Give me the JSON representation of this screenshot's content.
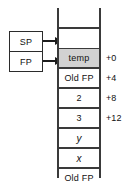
{
  "diagram": {
    "registers": {
      "sp_label": "SP",
      "fp_label": "FP"
    },
    "stack": {
      "cells": [
        {
          "label": "",
          "shaded": false,
          "italic": false,
          "empty": true
        },
        {
          "label": "",
          "shaded": false,
          "italic": false,
          "empty": true
        },
        {
          "label": "temp",
          "shaded": true,
          "italic": false,
          "empty": false
        },
        {
          "label": "Old FP",
          "shaded": false,
          "italic": false,
          "empty": false
        },
        {
          "label": "2",
          "shaded": false,
          "italic": false,
          "empty": false
        },
        {
          "label": "3",
          "shaded": false,
          "italic": false,
          "empty": false
        },
        {
          "label": "y",
          "shaded": false,
          "italic": true,
          "empty": false
        },
        {
          "label": "x",
          "shaded": false,
          "italic": true,
          "empty": false
        },
        {
          "label": "Old FP",
          "shaded": false,
          "italic": false,
          "empty": false
        }
      ]
    },
    "offsets": [
      {
        "label": "+0"
      },
      {
        "label": "+4"
      },
      {
        "label": "+8"
      },
      {
        "label": "+12"
      }
    ],
    "colors": {
      "line": "#3a3a3a",
      "shaded_cell": "#d2d2d2",
      "background": "#ffffff",
      "text": "#111111"
    }
  }
}
